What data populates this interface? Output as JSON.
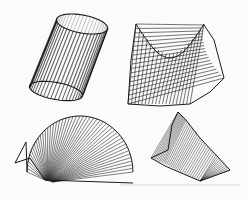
{
  "figure": {
    "title": "",
    "panels": [
      {
        "name": "ruled-cylinder",
        "description": "Cylinder drawn with straight ruling lines between two ellipses"
      },
      {
        "name": "hyperbolic-paraboloid",
        "description": "Saddle surface drawn with straight ruling lines"
      },
      {
        "name": "fan-surface",
        "description": "Fan-shaped ruled surface with lines radiating from a point"
      },
      {
        "name": "twisted-ruled-surface",
        "description": "Twisted ruled surface with dense shading lines"
      }
    ]
  },
  "colors": {
    "ink": "#1a1a1a",
    "background": "#fbfbfb",
    "baseline": "#d0d0d0"
  }
}
